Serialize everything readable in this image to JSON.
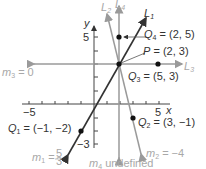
{
  "diagram": {
    "axes": {
      "x_label": "x",
      "y_label": "y",
      "x_ticks": {
        "neg": "−5",
        "pos": "5"
      },
      "y_ticks": {
        "pos": "5",
        "neg": "−3"
      }
    },
    "lines": [
      {
        "id": "L1",
        "label": "L",
        "sub": "1",
        "slope_label": "m",
        "slope_sub": "1",
        "slope_text": " = ",
        "slope_frac_num": "5",
        "slope_frac_den": "3",
        "color": "#333333"
      },
      {
        "id": "L2",
        "label": "L",
        "sub": "2",
        "slope_label": "m",
        "slope_sub": "2",
        "slope_text": " = −4",
        "color": "#8c8c8c"
      },
      {
        "id": "L3",
        "label": "L",
        "sub": "3",
        "slope_label": "m",
        "slope_sub": "3",
        "slope_text": " = 0",
        "color": "#8c8c8c"
      },
      {
        "id": "L4",
        "label": "L",
        "sub": "4",
        "slope_label": "m",
        "slope_sub": "4",
        "slope_text": " undefined",
        "color": "#8c8c8c"
      }
    ],
    "points": [
      {
        "id": "P",
        "name": "P",
        "sub": "",
        "coords": " = (2, 3)"
      },
      {
        "id": "Q1",
        "name": "Q",
        "sub": "1",
        "coords": " = (−1, −2)"
      },
      {
        "id": "Q2",
        "name": "Q",
        "sub": "2",
        "coords": " = (3, −1)"
      },
      {
        "id": "Q3",
        "name": "Q",
        "sub": "3",
        "coords": " = (5, 3)"
      },
      {
        "id": "Q4",
        "name": "Q",
        "sub": "4",
        "coords": " = (2, 5)"
      }
    ]
  }
}
